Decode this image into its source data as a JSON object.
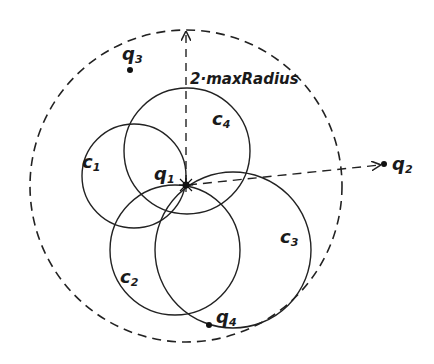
{
  "diagram": {
    "title_annotation": "2·maxRadius",
    "points": [
      {
        "id": "q1",
        "label": "q",
        "sub": "1",
        "x": 186,
        "y": 185
      },
      {
        "id": "q2",
        "label": "q",
        "sub": "2",
        "x": 384,
        "y": 164
      },
      {
        "id": "q3",
        "label": "q",
        "sub": "3",
        "x": 130,
        "y": 70
      },
      {
        "id": "q4",
        "label": "q",
        "sub": "4",
        "x": 209,
        "y": 325
      }
    ],
    "circles": [
      {
        "id": "c1",
        "label": "c",
        "sub": "1",
        "cx": 134,
        "cy": 176,
        "r": 52
      },
      {
        "id": "c2",
        "label": "c",
        "sub": "2",
        "cx": 175,
        "cy": 250,
        "r": 65
      },
      {
        "id": "c3",
        "label": "c",
        "sub": "3",
        "cx": 233,
        "cy": 250,
        "r": 78
      },
      {
        "id": "c4",
        "label": "c",
        "sub": "4",
        "cx": 187,
        "cy": 151,
        "r": 63
      }
    ],
    "outer_circle": {
      "label": "2·maxRadius",
      "cx": 186,
      "cy": 186,
      "r": 156,
      "style": "dashed"
    },
    "labels": {
      "q1": {
        "main": "q",
        "sub": "1"
      },
      "q2": {
        "main": "q",
        "sub": "2"
      },
      "q3": {
        "main": "q",
        "sub": "3"
      },
      "q4": {
        "main": "q",
        "sub": "4"
      },
      "c1": {
        "main": "c",
        "sub": "1"
      },
      "c2": {
        "main": "c",
        "sub": "2"
      },
      "c3": {
        "main": "c",
        "sub": "3"
      },
      "c4": {
        "main": "c",
        "sub": "4"
      },
      "radius": "2·maxRadius"
    },
    "colors": {
      "stroke": "#222222",
      "background": "#ffffff"
    }
  }
}
